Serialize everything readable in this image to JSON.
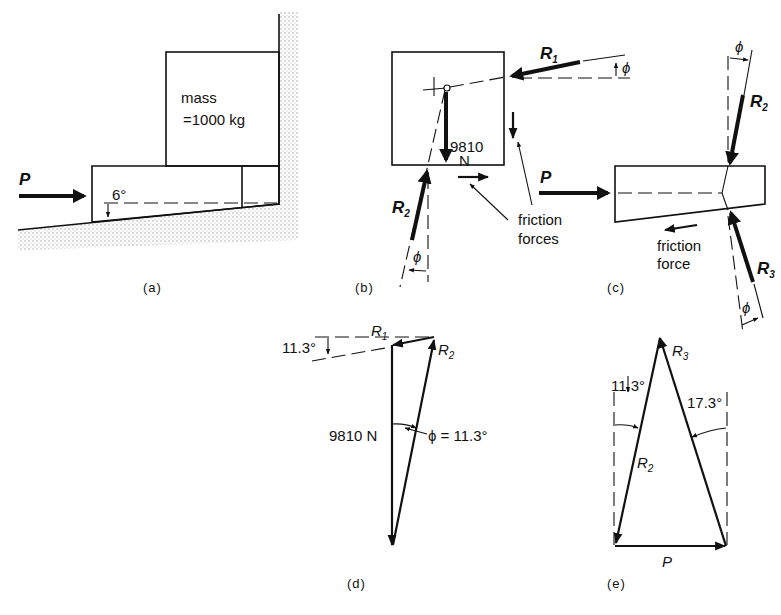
{
  "figure": {
    "panels": [
      {
        "id": "a",
        "caption": "(a)"
      },
      {
        "id": "b",
        "caption": "(b)"
      },
      {
        "id": "c",
        "caption": "(c)"
      },
      {
        "id": "d",
        "caption": "(d)"
      },
      {
        "id": "e",
        "caption": "(e)"
      }
    ]
  },
  "panel_a": {
    "force_label": "P",
    "mass_line1": "mass",
    "mass_line2": "=1000 kg",
    "wedge_angle": "6°"
  },
  "panel_b": {
    "r1_label": "R",
    "r1_sub": "1",
    "r2_label": "R",
    "r2_sub": "2",
    "phi": "ϕ",
    "weight_value": "9810",
    "weight_unit": "N",
    "friction_line1": "friction",
    "friction_line2": "forces"
  },
  "panel_c": {
    "force_label": "P",
    "r2_label": "R",
    "r2_sub": "2",
    "r3_label": "R",
    "r3_sub": "3",
    "phi": "ϕ",
    "friction_line1": "friction",
    "friction_line2": "force"
  },
  "panel_d": {
    "r1_label": "R",
    "r1_sub": "1",
    "r2_label": "R",
    "r2_sub": "2",
    "angle_label": "11.3°",
    "weight_label": "9810 N",
    "phi_label": "ϕ = 11.3°"
  },
  "panel_e": {
    "r3_label": "R",
    "r3_sub": "3",
    "r2_label": "R",
    "r2_sub": "2",
    "angle_left": "11.3°",
    "angle_right": "17.3°",
    "p_label": "P"
  }
}
